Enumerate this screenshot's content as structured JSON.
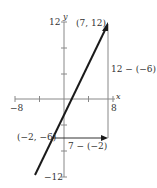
{
  "diagram": {
    "type": "coordinate-plane-slope",
    "axes": {
      "x_label": "x",
      "y_label": "y",
      "x_min_label": "−8",
      "x_max_label": "8",
      "y_max_label": "12",
      "y_min_label": "−12"
    },
    "points": [
      {
        "label": "(7, 12)",
        "x": 7,
        "y": 12
      },
      {
        "label": "(−2, −6)",
        "x": -2,
        "y": -6
      }
    ],
    "annotations": {
      "rise": "12 − (−6)",
      "run": "7 − (−2)"
    },
    "colors": {
      "line": "#1a1a1a",
      "axis": "#808080",
      "text": "#333333"
    }
  }
}
